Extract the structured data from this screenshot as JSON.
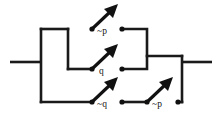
{
  "diagram": {
    "stroke_color": "#1a1a1a",
    "label_color": "#111111",
    "background": "#ffffff",
    "terminals": {
      "left_lead_label": "",
      "right_lead_label": ""
    },
    "branches": [
      {
        "name": "inner-parallel-block",
        "switches": [
          {
            "id": "switch-not-p-top",
            "label": "~p",
            "state": "open",
            "row": "top"
          },
          {
            "id": "switch-q-middle",
            "label": "q",
            "state": "open",
            "row": "middle"
          }
        ]
      },
      {
        "name": "bottom-series-branch",
        "switches": [
          {
            "id": "switch-not-q-bottom",
            "label": "~q",
            "state": "open",
            "row": "bottom"
          },
          {
            "id": "switch-not-p-bottom",
            "label": "~p",
            "state": "open",
            "row": "bottom"
          }
        ]
      }
    ],
    "labels": {
      "top": "~p",
      "middle": "q",
      "bottom_left": "~q",
      "bottom_right": "~p"
    }
  }
}
